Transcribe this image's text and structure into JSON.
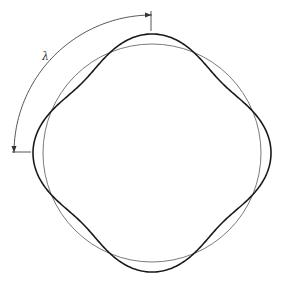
{
  "diagram": {
    "wavelength_label": "λ",
    "reference_circle": {
      "cx": 152,
      "cy": 153,
      "r": 109,
      "color": "#7a7a7a"
    },
    "wave": {
      "cx": 152,
      "cy": 153,
      "r": 109,
      "amplitude": 10,
      "lobes": 4,
      "color": "#1a1a1a"
    },
    "dimension_arc": {
      "cx": 152,
      "cy": 153,
      "r": 138,
      "color": "#444444"
    }
  }
}
